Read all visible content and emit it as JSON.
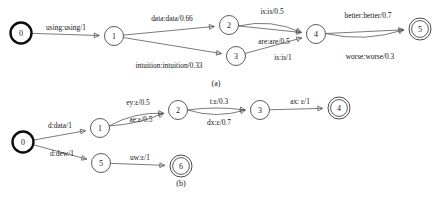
{
  "figure": {
    "stroke_color": "#59595e",
    "node_stroke_color": "#4a4a4a",
    "initial_stroke_color": "#0d0d0d",
    "background_color": "#ffffff"
  },
  "panels": [
    {
      "id": "panel-a",
      "caption": "(a)",
      "caption_x": 216,
      "caption_y": 86,
      "nodes": [
        {
          "id": "a0",
          "label": "0",
          "cx": 21,
          "cy": 33,
          "r": 10.5,
          "type": "initial"
        },
        {
          "id": "a1",
          "label": "1",
          "cx": 114,
          "cy": 36,
          "r": 9.5,
          "type": "normal"
        },
        {
          "id": "a2",
          "label": "2",
          "cx": 229,
          "cy": 25,
          "r": 9.5,
          "type": "normal"
        },
        {
          "id": "a3",
          "label": "3",
          "cx": 236,
          "cy": 56,
          "r": 9.5,
          "type": "normal"
        },
        {
          "id": "a4",
          "label": "4",
          "cx": 316,
          "cy": 34,
          "r": 9.5,
          "type": "normal"
        },
        {
          "id": "a5",
          "label": "5",
          "cx": 420,
          "cy": 29,
          "r": 11.0,
          "type": "final"
        }
      ],
      "edges": [
        {
          "id": "a-e0",
          "from": "a0",
          "to": "a1",
          "label": "using:using/1",
          "label_x": 66,
          "label_y": 30,
          "curve": 0
        },
        {
          "id": "a-e1",
          "from": "a1",
          "to": "a2",
          "label": "data:data/0.66",
          "label_x": 172,
          "label_y": 21,
          "curve": 0
        },
        {
          "id": "a-e2",
          "from": "a1",
          "to": "a3",
          "label": "intuition:intuition/0.33",
          "label_x": 169,
          "label_y": 68,
          "curve": 0
        },
        {
          "id": "a-e3",
          "from": "a2",
          "to": "a4",
          "label": "is:is/0.5",
          "label_x": 272,
          "label_y": 14,
          "curve": -11
        },
        {
          "id": "a-e4",
          "from": "a2",
          "to": "a4",
          "label": "are:are/0.5",
          "label_x": 274,
          "label_y": 44,
          "curve": 0
        },
        {
          "id": "a-e5",
          "from": "a3",
          "to": "a4",
          "label": "is:is/1",
          "label_x": 283,
          "label_y": 60,
          "curve": 0
        },
        {
          "id": "a-e6",
          "from": "a4",
          "to": "a5",
          "label": "better:better/0.7",
          "label_x": 368,
          "label_y": 18,
          "curve": 0
        },
        {
          "id": "a-e7",
          "from": "a4",
          "to": "a5",
          "label": "worse:worse/0.3",
          "label_x": 370,
          "label_y": 59,
          "curve": 11
        }
      ]
    },
    {
      "id": "panel-b",
      "caption": "(b)",
      "caption_x": 181,
      "caption_y": 186,
      "nodes": [
        {
          "id": "b0",
          "label": "0",
          "cx": 23,
          "cy": 142,
          "r": 10.5,
          "type": "initial"
        },
        {
          "id": "b1",
          "label": "1",
          "cx": 100,
          "cy": 128,
          "r": 9.5,
          "type": "normal"
        },
        {
          "id": "b2",
          "label": "2",
          "cx": 178,
          "cy": 110,
          "r": 9.5,
          "type": "normal"
        },
        {
          "id": "b3",
          "label": "3",
          "cx": 260,
          "cy": 110,
          "r": 9.5,
          "type": "normal"
        },
        {
          "id": "b4",
          "label": "4",
          "cx": 339,
          "cy": 108,
          "r": 11.0,
          "type": "final"
        },
        {
          "id": "b5",
          "label": "5",
          "cx": 101,
          "cy": 163,
          "r": 9.5,
          "type": "normal"
        },
        {
          "id": "b6",
          "label": "6",
          "cx": 181,
          "cy": 166,
          "r": 11.0,
          "type": "final"
        }
      ],
      "edges": [
        {
          "id": "b-e0",
          "from": "b0",
          "to": "b1",
          "label": "d:data/1",
          "label_x": 60,
          "label_y": 128,
          "curve": 0
        },
        {
          "id": "b-e1",
          "from": "b0",
          "to": "b5",
          "label": "d:dew/1",
          "label_x": 62,
          "label_y": 156,
          "curve": 0
        },
        {
          "id": "b-e2",
          "from": "b1",
          "to": "b2",
          "label": "ey:ε/0.5",
          "label_x": 138,
          "label_y": 105,
          "curve": -8
        },
        {
          "id": "b-e3",
          "from": "b1",
          "to": "b2",
          "label": "ae:ε/0.5",
          "label_x": 141,
          "label_y": 122,
          "curve": 5
        },
        {
          "id": "b-e4",
          "from": "b2",
          "to": "b3",
          "label": "t:ε/0.3",
          "label_x": 219,
          "label_y": 104,
          "curve": -4
        },
        {
          "id": "b-e5",
          "from": "b2",
          "to": "b3",
          "label": "dx:ε/0.7",
          "label_x": 219,
          "label_y": 125,
          "curve": 9
        },
        {
          "id": "b-e6",
          "from": "b3",
          "to": "b4",
          "label": "ax: ε/1",
          "label_x": 300,
          "label_y": 104,
          "curve": 0
        },
        {
          "id": "b-e7",
          "from": "b5",
          "to": "b6",
          "label": "uw:ε/1",
          "label_x": 140,
          "label_y": 160,
          "curve": 0
        }
      ]
    }
  ]
}
